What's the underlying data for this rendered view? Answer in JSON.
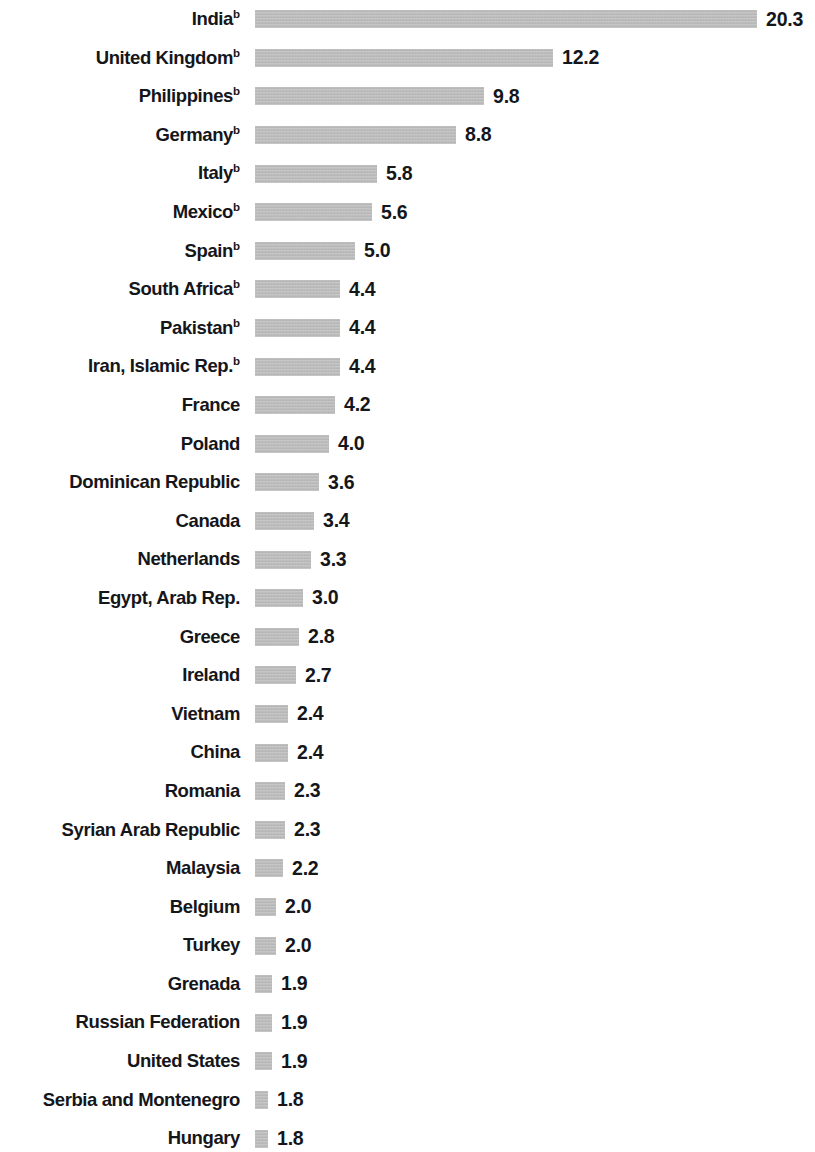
{
  "chart_data": {
    "type": "bar",
    "orientation": "horizontal",
    "title": "",
    "subtitle": "",
    "xlabel": "",
    "ylabel": "",
    "grid": false,
    "legend": null,
    "axis_visible": false,
    "value_labels_shown": true,
    "value_label_format": "0.0",
    "xlim": [
      0,
      20.3
    ],
    "bar_color": "#b9b9b9",
    "text_color": "#15161a",
    "background": "#ffffff",
    "footnote_marker": "b",
    "categories": [
      "India",
      "United Kingdom",
      "Philippines",
      "Germany",
      "Italy",
      "Mexico",
      "Spain",
      "South Africa",
      "Pakistan",
      "Iran, Islamic Rep.",
      "France",
      "Poland",
      "Dominican Republic",
      "Canada",
      "Netherlands",
      "Egypt, Arab Rep.",
      "Greece",
      "Ireland",
      "Vietnam",
      "China",
      "Romania",
      "Syrian Arab Republic",
      "Malaysia",
      "Belgium",
      "Turkey",
      "Grenada",
      "Russian Federation",
      "United States",
      "Serbia and Montenegro",
      "Hungary"
    ],
    "values": [
      20.3,
      12.2,
      9.8,
      8.8,
      5.8,
      5.6,
      5.0,
      4.4,
      4.4,
      4.4,
      4.2,
      4.0,
      3.6,
      3.4,
      3.3,
      3.0,
      2.8,
      2.7,
      2.4,
      2.4,
      2.3,
      2.3,
      2.2,
      2.0,
      2.0,
      1.9,
      1.9,
      1.9,
      1.8,
      1.8
    ]
  },
  "rows": [
    {
      "label": "India",
      "sup": "b",
      "value": "20.3",
      "bar_px": 502
    },
    {
      "label": "United Kingdom",
      "sup": "b",
      "value": "12.2",
      "bar_px": 298
    },
    {
      "label": "Philippines",
      "sup": "b",
      "value": "9.8",
      "bar_px": 229
    },
    {
      "label": "Germany",
      "sup": "b",
      "value": "8.8",
      "bar_px": 201
    },
    {
      "label": "Italy",
      "sup": "b",
      "value": "5.8",
      "bar_px": 122
    },
    {
      "label": "Mexico",
      "sup": "b",
      "value": "5.6",
      "bar_px": 117
    },
    {
      "label": "Spain",
      "sup": "b",
      "value": "5.0",
      "bar_px": 100
    },
    {
      "label": "South Africa",
      "sup": "b",
      "value": "4.4",
      "bar_px": 85
    },
    {
      "label": "Pakistan",
      "sup": "b",
      "value": "4.4",
      "bar_px": 85
    },
    {
      "label": "Iran, Islamic Rep.",
      "sup": "b",
      "value": "4.4",
      "bar_px": 85
    },
    {
      "label": "France",
      "sup": "",
      "value": "4.2",
      "bar_px": 80
    },
    {
      "label": "Poland",
      "sup": "",
      "value": "4.0",
      "bar_px": 74
    },
    {
      "label": "Dominican Republic",
      "sup": "",
      "value": "3.6",
      "bar_px": 64
    },
    {
      "label": "Canada",
      "sup": "",
      "value": "3.4",
      "bar_px": 59
    },
    {
      "label": "Netherlands",
      "sup": "",
      "value": "3.3",
      "bar_px": 56
    },
    {
      "label": "Egypt, Arab Rep.",
      "sup": "",
      "value": "3.0",
      "bar_px": 48
    },
    {
      "label": "Greece",
      "sup": "",
      "value": "2.8",
      "bar_px": 44
    },
    {
      "label": "Ireland",
      "sup": "",
      "value": "2.7",
      "bar_px": 41
    },
    {
      "label": "Vietnam",
      "sup": "",
      "value": "2.4",
      "bar_px": 33
    },
    {
      "label": "China",
      "sup": "",
      "value": "2.4",
      "bar_px": 33
    },
    {
      "label": "Romania",
      "sup": "",
      "value": "2.3",
      "bar_px": 30
    },
    {
      "label": "Syrian Arab Republic",
      "sup": "",
      "value": "2.3",
      "bar_px": 30
    },
    {
      "label": "Malaysia",
      "sup": "",
      "value": "2.2",
      "bar_px": 28
    },
    {
      "label": "Belgium",
      "sup": "",
      "value": "2.0",
      "bar_px": 21
    },
    {
      "label": "Turkey",
      "sup": "",
      "value": "2.0",
      "bar_px": 21
    },
    {
      "label": "Grenada",
      "sup": "",
      "value": "1.9",
      "bar_px": 17
    },
    {
      "label": "Russian Federation",
      "sup": "",
      "value": "1.9",
      "bar_px": 17
    },
    {
      "label": "United States",
      "sup": "",
      "value": "1.9",
      "bar_px": 17
    },
    {
      "label": "Serbia and Montenegro",
      "sup": "",
      "value": "1.8",
      "bar_px": 13
    },
    {
      "label": "Hungary",
      "sup": "",
      "value": "1.8",
      "bar_px": 13
    }
  ]
}
